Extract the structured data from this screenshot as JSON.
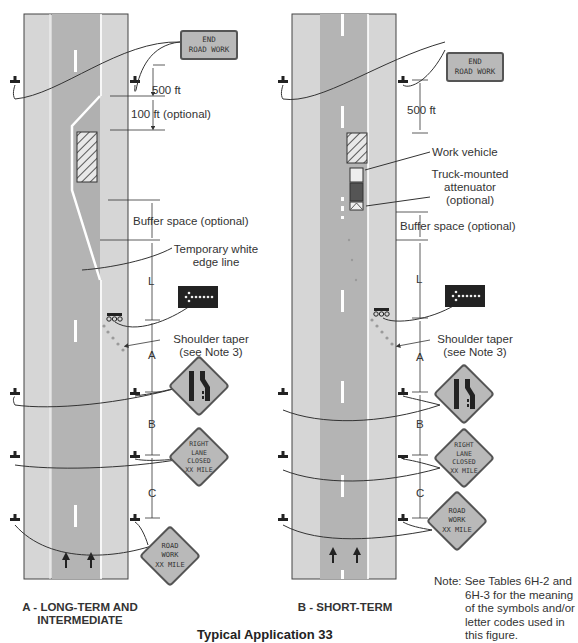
{
  "figure": {
    "title_partial": "Typical Application 33",
    "note": [
      "Note: See Tables 6H-2 and",
      "6H-3 for the meaning",
      "of the symbols and/or",
      "letter codes used in",
      "this figure."
    ]
  },
  "panel_a": {
    "caption": [
      "A - LONG-TERM AND",
      "INTERMEDIATE"
    ],
    "signs": {
      "end_road_work": [
        "END",
        "ROAD WORK"
      ],
      "lane_ends": "lane-ends-merge-left-symbol",
      "right_lane_closed": [
        "RIGHT",
        "LANE",
        "CLOSED",
        "XX MILE"
      ],
      "road_work_ahead": [
        "ROAD",
        "WORK",
        "XX MILE"
      ]
    },
    "labels": {
      "d500": "500 ft",
      "d100": "100 ft (optional)",
      "buffer": "Buffer space (optional)",
      "edge_line": [
        "Temporary white",
        "edge line"
      ],
      "L": "L",
      "shoulder_taper": [
        "Shoulder taper",
        "(see Note 3)"
      ],
      "A": "A",
      "B": "B",
      "C": "C"
    }
  },
  "panel_b": {
    "caption": [
      "B - SHORT-TERM"
    ],
    "signs": {
      "end_road_work": [
        "END",
        "ROAD WORK"
      ],
      "lane_ends": "lane-ends-merge-left-symbol",
      "right_lane_closed": [
        "RIGHT",
        "LANE",
        "CLOSED",
        "XX MILE"
      ],
      "road_work_ahead": [
        "ROAD",
        "WORK",
        "XX MILE"
      ]
    },
    "labels": {
      "d500": "500 ft",
      "work_vehicle": "Work vehicle",
      "tma": [
        "Truck-mounted",
        "attenuator",
        "(optional)"
      ],
      "buffer": "Buffer space (optional)",
      "L": "L",
      "shoulder_taper": [
        "Shoulder taper",
        "(see Note 3)"
      ],
      "A": "A",
      "B": "B",
      "C": "C"
    }
  },
  "colors": {
    "shoulder": "#d6d6d6",
    "lane": "#b4b4b4",
    "sign_fill": "#b9b9b9",
    "line": "#333333"
  }
}
